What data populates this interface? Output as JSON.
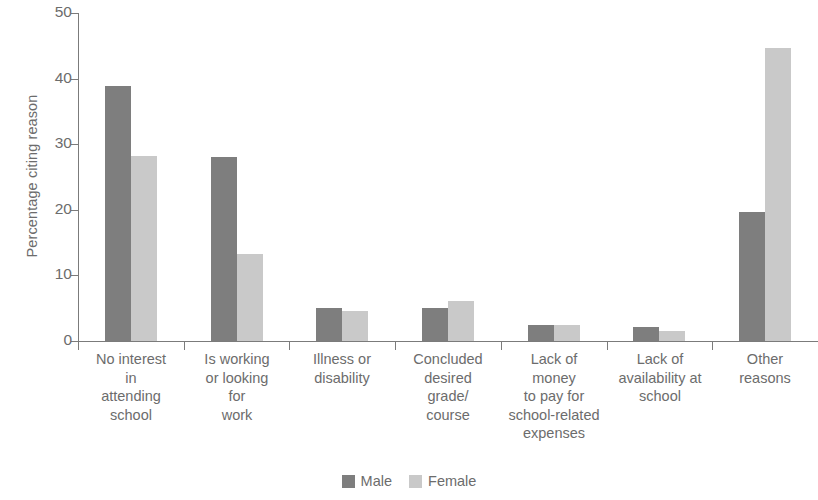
{
  "chart_data": {
    "type": "bar",
    "title": "",
    "subtitle": "",
    "xlabel": "",
    "ylabel": "Percentage citing reason",
    "ylim": [
      0,
      50
    ],
    "yticks": [
      0,
      10,
      20,
      30,
      40,
      50
    ],
    "ytick_labels": [
      "0",
      "10",
      "20",
      "30",
      "40",
      "50"
    ],
    "grid": false,
    "legend_position": "bottom-center",
    "categories": [
      "No interest in attending school",
      "Is working or looking for work",
      "Illness or disability",
      "Concluded desired grade/ course",
      "Lack of money to pay for school-related expenses",
      "Lack of availability at school",
      "Other reasons"
    ],
    "category_lines": [
      [
        "No interest",
        "in",
        "attending",
        "school"
      ],
      [
        "Is working",
        "or looking",
        "for",
        "work"
      ],
      [
        "Illness or",
        "disability"
      ],
      [
        "Concluded",
        "desired",
        "grade/",
        "course"
      ],
      [
        "Lack of",
        "money",
        "to pay for",
        "school-related",
        "expenses"
      ],
      [
        "Lack of",
        "availability at",
        "school"
      ],
      [
        "Other",
        "reasons"
      ]
    ],
    "series": [
      {
        "name": "Male",
        "color": "#7e7e7e",
        "values": [
          38.8,
          28.0,
          5.1,
          5.0,
          2.5,
          2.2,
          19.7
        ]
      },
      {
        "name": "Female",
        "color": "#c9c9c9",
        "values": [
          28.2,
          13.3,
          4.6,
          6.1,
          2.5,
          1.5,
          44.6
        ]
      }
    ]
  },
  "legend": {
    "items": [
      {
        "label": "Male",
        "color": "#7e7e7e"
      },
      {
        "label": "Female",
        "color": "#c9c9c9"
      }
    ]
  },
  "axes": {
    "y_title": "Percentage citing reason",
    "axis_color": "#7b7b7b",
    "text_color": "#6c6c6c"
  }
}
